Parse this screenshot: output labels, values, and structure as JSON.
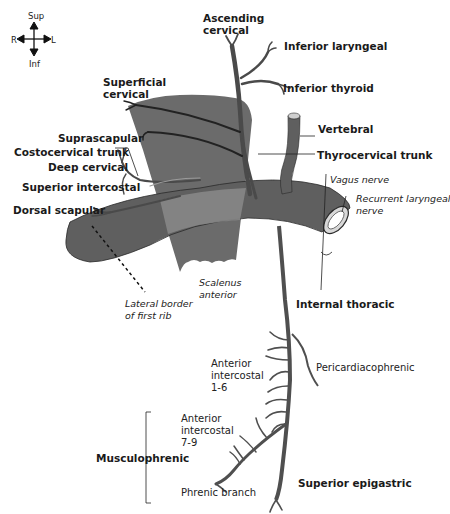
{
  "compass": {
    "up": "Sup",
    "down": "Inf",
    "left": "R",
    "right": "L"
  },
  "labels": {
    "ascending_cervical": [
      "Ascending",
      "cervical"
    ],
    "inferior_laryngeal": "Inferior laryngeal",
    "inferior_thyroid": "Inferior thyroid",
    "superficial_cervical": [
      "Superficial",
      "cervical"
    ],
    "vertebral": "Vertebral",
    "suprascapular": "Suprascapular",
    "costocervical_trunk": "Costocervical trunk",
    "deep_cervical": "Deep cervical",
    "thyrocervical_trunk": "Thyrocervical trunk",
    "superior_intercostal": "Superior intercostal",
    "vagus_nerve": "Vagus nerve",
    "recurrent_laryngeal_nerve": [
      "Recurrent laryngeal",
      "nerve"
    ],
    "dorsal_scapular": "Dorsal scapular",
    "scalenus_anterior": [
      "Scalenus",
      "anterior"
    ],
    "lateral_border_first_rib": [
      "Lateral border",
      "of first rib"
    ],
    "internal_thoracic": "Internal thoracic",
    "anterior_intercostal_1_6": [
      "Anterior",
      "intercostal",
      "1-6"
    ],
    "pericardiacophrenic": "Pericardiacophrenic",
    "anterior_intercostal_7_9": [
      "Anterior",
      "intercostal",
      "7-9"
    ],
    "musculophrenic": "Musculophrenic",
    "phrenic_branch": "Phrenic branch",
    "superior_epigastric": "Superior epigastric"
  },
  "colors": {
    "vessel": "#5f5f5f",
    "vessel_outline": "#2a2a2a",
    "muscle": "#6b6b6b",
    "muscle_overlap": "#8a8a8a",
    "text": "#1a1a1a"
  }
}
